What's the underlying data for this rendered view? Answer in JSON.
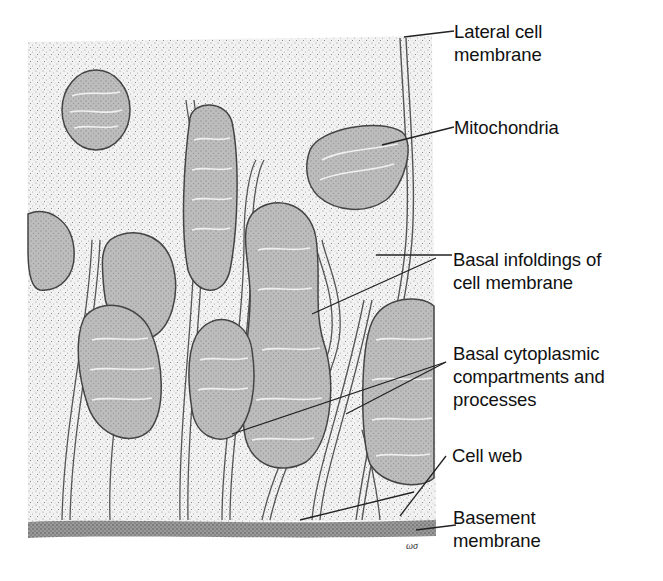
{
  "figure": {
    "colors": {
      "background": "#ffffff",
      "cytoplasm_stipple": "#e9e9e9",
      "mitochondria_fill": "#b9b9b9",
      "membrane_line": "#444444",
      "text": "#111111",
      "leader_line": "#222222"
    },
    "labels": [
      {
        "id": "lateral-cell-membrane",
        "line1": "Lateral cell",
        "line2": "membrane",
        "line3": null
      },
      {
        "id": "mitochondria",
        "line1": "Mitochondria",
        "line2": null,
        "line3": null
      },
      {
        "id": "basal-infoldings",
        "line1": "Basal infoldings of",
        "line2": "cell membrane",
        "line3": null
      },
      {
        "id": "basal-cytoplasmic-compartments",
        "line1": "Basal cytoplasmic",
        "line2": "compartments and",
        "line3": "processes"
      },
      {
        "id": "cell-web",
        "line1": "Cell web",
        "line2": null,
        "line3": null
      },
      {
        "id": "basement-membrane",
        "line1": "Basement",
        "line2": "membrane",
        "line3": null
      }
    ],
    "artist_signature": "ωσ"
  }
}
